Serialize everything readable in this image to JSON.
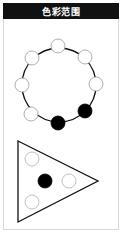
{
  "header": {
    "title": "色彩范围"
  },
  "colors": {
    "header_bg": "#111111",
    "header_text": "#ffffff",
    "line": "#111111",
    "dot_filled": "#000000",
    "dot_empty": "#ffffff",
    "dot_faint_stroke": "#b0b0b0",
    "frame_border": "#d8d8d8"
  },
  "ring": {
    "center": [
      59,
      85
    ],
    "radius": 37,
    "dot_radius": 7,
    "dots": [
      {
        "position": "top",
        "x": 58,
        "y": 46,
        "filled": false
      },
      {
        "position": "upper-right",
        "x": 85,
        "y": 57,
        "filled": false
      },
      {
        "position": "right",
        "x": 96,
        "y": 84,
        "filled": false
      },
      {
        "position": "lower-right",
        "x": 85,
        "y": 111,
        "filled": true
      },
      {
        "position": "bottom",
        "x": 58,
        "y": 123,
        "filled": true
      },
      {
        "position": "lower-left",
        "x": 31,
        "y": 114,
        "filled": false
      },
      {
        "position": "left",
        "x": 22,
        "y": 85,
        "filled": false
      },
      {
        "position": "upper-left",
        "x": 32,
        "y": 58,
        "filled": false
      }
    ]
  },
  "triangle": {
    "vertices": [
      [
        18,
        141
      ],
      [
        98,
        181
      ],
      [
        18,
        222
      ]
    ],
    "dot_radius": 7,
    "dots": [
      {
        "position": "upper",
        "x": 32,
        "y": 159,
        "filled": false
      },
      {
        "position": "center",
        "x": 45,
        "y": 181,
        "filled": true
      },
      {
        "position": "right",
        "x": 69,
        "y": 181,
        "filled": false
      },
      {
        "position": "lower",
        "x": 32,
        "y": 202,
        "filled": false
      }
    ]
  }
}
